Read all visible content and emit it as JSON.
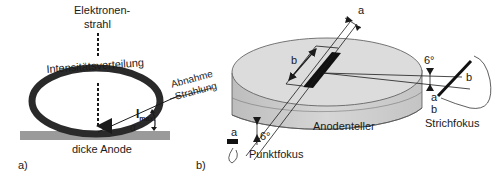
{
  "panel_a": {
    "label": "a)",
    "beam_label_line1": "Elektronen-",
    "beam_label_line2": "strahl",
    "distribution_label": "Intensitätsverteilung",
    "imax_label": "I",
    "imax_sub": "max.",
    "alpha_label": "α",
    "decrease_label_line1": "Abnahme",
    "decrease_label_line2": "Strahlung",
    "anode_label": "dicke Anode"
  },
  "panel_b": {
    "label": "b)",
    "anode_disk_label": "Anodenteller",
    "dim_a_top": "a",
    "dim_b_top": "b",
    "point_focus_label": "Punktfokus",
    "point_focus_a": "a",
    "point_focus_angle": "6°",
    "line_focus_label": "Strichfokus",
    "line_focus_angle": "6°",
    "line_focus_a": "a",
    "line_focus_b1": "b",
    "line_focus_b2": "b"
  },
  "colors": {
    "ink": "#1a1a1a",
    "anode_gray": "#9a9a9a",
    "disk_top": "#dcdcdc",
    "disk_side": "#c8c8c8",
    "focus_bar": "#111111"
  }
}
